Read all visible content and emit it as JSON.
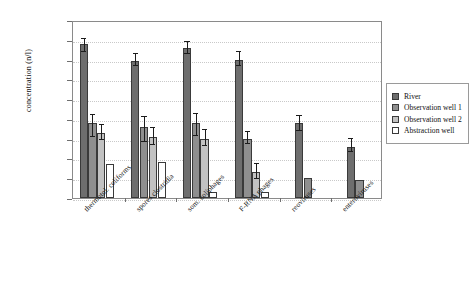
{
  "chart_data": {
    "type": "bar",
    "title": "",
    "xlabel": "",
    "ylabel": "concentration (n/l)",
    "yscale": "log",
    "ylim": [
      0.001,
      1000000
    ],
    "ytick_labels": [
      "1000000",
      "100000",
      "10000",
      "1000",
      "100",
      "10",
      "1",
      "0,1",
      "0,01",
      "0,001"
    ],
    "ytick_values": [
      1000000,
      100000,
      10000,
      1000,
      100,
      10,
      1,
      0.1,
      0.01,
      0.001
    ],
    "grid": true,
    "legend_position": "right",
    "categories": [
      "thermotol. coliforms",
      "spores clostridia",
      "som. coliphages",
      "F-RNA phages",
      "reoviruses",
      "enteroviruses"
    ],
    "series": [
      {
        "name": "River",
        "color": "#6e6e6e",
        "values": [
          60000,
          8000,
          40000,
          9000,
          6,
          0.4
        ],
        "err_low": [
          25000,
          5000,
          20000,
          5000,
          2.5,
          0.22
        ],
        "err_high": [
          110000,
          20000,
          80000,
          25000,
          14,
          0.95
        ]
      },
      {
        "name": "Observation well 1",
        "color": "#8f8f8f",
        "values": [
          6,
          4,
          6,
          1,
          0.01,
          0.008
        ],
        "err_low": [
          1.2,
          0.7,
          1.4,
          0.55,
          null,
          null
        ],
        "err_high": [
          16,
          13,
          18,
          2.2,
          null,
          null
        ]
      },
      {
        "name": "Observation well 2",
        "color": "#c2c2c2",
        "values": [
          2,
          1.2,
          1,
          0.02,
          null,
          null
        ],
        "err_low": [
          0.9,
          0.5,
          0.45,
          0.009,
          null,
          null
        ],
        "err_high": [
          5,
          3.5,
          2.6,
          0.05,
          null,
          null
        ]
      },
      {
        "name": "Abstraction well",
        "color": "#ffffff",
        "values": [
          0.05,
          0.07,
          0.002,
          0.002,
          null,
          null
        ],
        "err_low": [
          null,
          null,
          null,
          null,
          null,
          null
        ],
        "err_high": [
          null,
          null,
          null,
          null,
          null,
          null
        ]
      }
    ]
  }
}
